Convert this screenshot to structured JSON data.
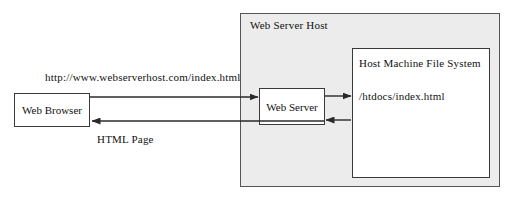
{
  "diagram": {
    "nodes": {
      "browser": {
        "label": "Web Browser"
      },
      "host": {
        "label": "Web Server Host"
      },
      "server": {
        "label": "Web Server"
      },
      "filesystem": {
        "label": "Host Machine File System",
        "path": "/htdocs/index.html"
      }
    },
    "edges": {
      "request": {
        "label": "http://www.webserverhost.com/index.html",
        "direction": "browser-to-server"
      },
      "response": {
        "label": "HTML Page",
        "direction": "server-to-browser"
      },
      "file_read": {
        "label": "",
        "direction": "server-to-filesystem"
      },
      "file_return": {
        "label": "",
        "direction": "filesystem-to-server"
      }
    },
    "colors": {
      "host_background": "#ececec",
      "node_background": "#ffffff",
      "stroke": "#3a3a3a",
      "text": "#111111"
    }
  }
}
